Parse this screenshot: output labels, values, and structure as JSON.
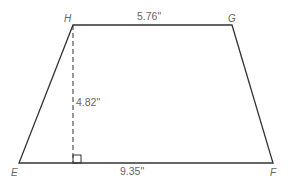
{
  "figure": {
    "shape": "trapezoid",
    "vertices": {
      "H": {
        "label": "H",
        "x": 73,
        "y": 25
      },
      "G": {
        "label": "G",
        "x": 232,
        "y": 25
      },
      "E": {
        "label": "E",
        "x": 19,
        "y": 163
      },
      "F": {
        "label": "F",
        "x": 273,
        "y": 163
      }
    },
    "dimensions": {
      "top_base": "5.76\"",
      "bottom_base": "9.35\"",
      "height": "4.82\""
    },
    "right_angle_marker": true,
    "height_line_style": "dashed",
    "colors": {
      "stroke": "#333333",
      "label": "#666666",
      "background": "#ffffff"
    }
  }
}
